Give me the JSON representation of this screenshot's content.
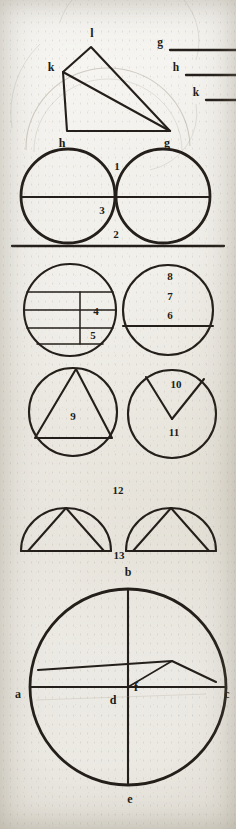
{
  "page": {
    "kind": "manuscript-geometry-plate",
    "width": 236,
    "height": 829,
    "ink_color": "#241f1a",
    "paper_color": "#eceae3",
    "ghost_color": "#9a9384"
  },
  "reference_segments": {
    "caption": "Labelled reference lengths",
    "items": [
      {
        "label": "g",
        "name": "segment-g"
      },
      {
        "label": "h",
        "name": "segment-h"
      },
      {
        "label": "k",
        "name": "segment-k"
      }
    ]
  },
  "figure_quadrilateral": {
    "name": "quadrilateral-klgh",
    "vertices": [
      {
        "label": "l"
      },
      {
        "label": "k"
      },
      {
        "label": "h"
      },
      {
        "label": "g"
      }
    ]
  },
  "figure_twin_circles": {
    "name": "twin-tangent-circles",
    "labels": [
      {
        "label": "1"
      },
      {
        "label": "3"
      },
      {
        "label": "2"
      }
    ]
  },
  "figure_divided_circle": {
    "name": "circle-with-inscribed-cells",
    "labels": [
      {
        "label": "4"
      },
      {
        "label": "5"
      }
    ]
  },
  "figure_halved_circle": {
    "name": "circle-with-diameter",
    "labels": [
      {
        "label": "8"
      },
      {
        "label": "7"
      },
      {
        "label": "6"
      }
    ]
  },
  "figure_inscribed_triangle": {
    "name": "circle-with-inscribed-triangle",
    "labels": [
      {
        "label": "9"
      }
    ]
  },
  "figure_sector": {
    "name": "circle-with-sector-wedge",
    "labels": [
      {
        "label": "10"
      },
      {
        "label": "11"
      }
    ]
  },
  "figure_semicircles": {
    "name": "semicircles-with-triangles",
    "labels": [
      {
        "label": "12"
      },
      {
        "label": "13"
      }
    ]
  },
  "figure_main_circle": {
    "name": "great-circle-with-chords",
    "points": [
      {
        "label": "b",
        "position": "top"
      },
      {
        "label": "a",
        "position": "left"
      },
      {
        "label": "d",
        "position": "center"
      },
      {
        "label": "c",
        "position": "right"
      },
      {
        "label": "e",
        "position": "bottom"
      },
      {
        "label": "f",
        "position": "chord-intersection"
      }
    ]
  }
}
